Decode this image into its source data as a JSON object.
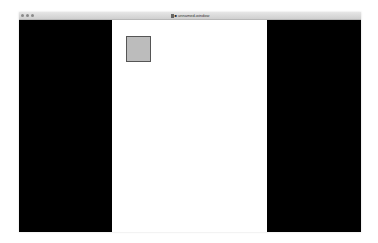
{
  "window": {
    "title": "■ unnamed-window"
  },
  "colors": {
    "panel": "#000000",
    "content_bg": "#ffffff",
    "square_fill": "#bcbcbc",
    "square_border": "#555555"
  },
  "icons": {
    "close": "close-button",
    "minimize": "minimize-button",
    "maximize": "maximize-button",
    "title_doc": "document-icon"
  }
}
